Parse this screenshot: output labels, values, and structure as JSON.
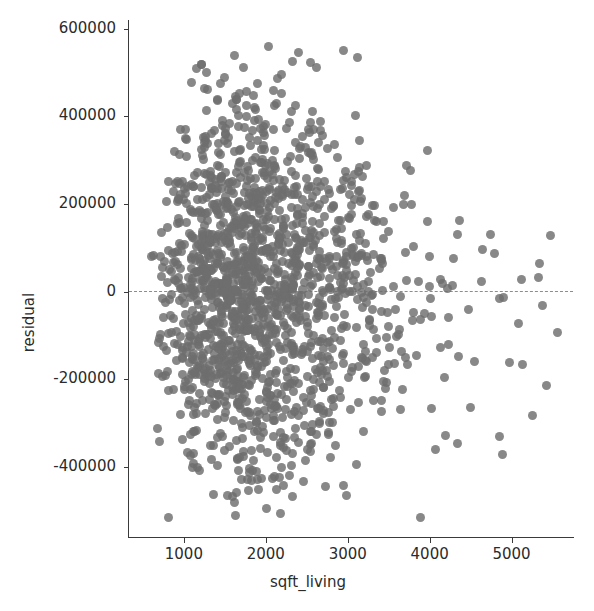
{
  "figure": {
    "background_color": "#ffffff",
    "point_color": "#6e6e6e",
    "axis_color": "#3a3a3a",
    "reference_line_color": "#8d8d8d"
  },
  "axes": {
    "xlabel": "sqft_living",
    "ylabel": "residual",
    "xticks": [
      "1000",
      "2000",
      "3000",
      "4000",
      "5000"
    ],
    "yticks": [
      "600000",
      "400000",
      "200000",
      "0",
      "-200000",
      "-400000"
    ]
  },
  "chart_data": {
    "type": "scatter",
    "title": "",
    "xlabel": "sqft_living",
    "ylabel": "residual",
    "xlim": [
      330,
      5750
    ],
    "ylim": [
      -560000,
      620000
    ],
    "grid": false,
    "legend": null,
    "xtick_values": [
      1000,
      2000,
      3000,
      4000,
      5000
    ],
    "ytick_values": [
      600000,
      400000,
      200000,
      0,
      -200000,
      -400000
    ],
    "xtick_labels": [
      "1000",
      "2000",
      "3000",
      "4000",
      "5000"
    ],
    "ytick_labels": [
      "600000",
      "400000",
      "200000",
      "0",
      "-200000",
      "-400000"
    ],
    "annotations": [
      {
        "type": "hline",
        "y": 0,
        "style": "dashed",
        "color": "#8d8d8d",
        "label": "zero residual"
      }
    ],
    "marker": {
      "shape": "circle",
      "size_px": 9,
      "color": "#6e6e6e",
      "alpha": 0.82
    },
    "n_points": 1600,
    "series": [
      {
        "name": "residuals",
        "x": [
          760,
          1200,
          1680,
          2100,
          2560,
          3050,
          3500,
          4100,
          4600,
          5300
        ],
        "y": [
          -20000,
          40000,
          110000,
          -60000,
          150000,
          -130000,
          60000,
          -210000,
          90000,
          -205000
        ],
        "note": "x/y above are representative samples; the full cloud is generated deterministically from the spread model below"
      }
    ],
    "spread_model": {
      "x_center": 1950,
      "x_min": 330,
      "x_max": 5750,
      "peak_sigma": 150000,
      "note": "sigma(x) grows from ~90000 at 500 sqft to ~185000 near 2000 sqft then decays toward ~150000 at 5000 sqft; density is concentrated between 1000 and 2800 sqft"
    }
  }
}
